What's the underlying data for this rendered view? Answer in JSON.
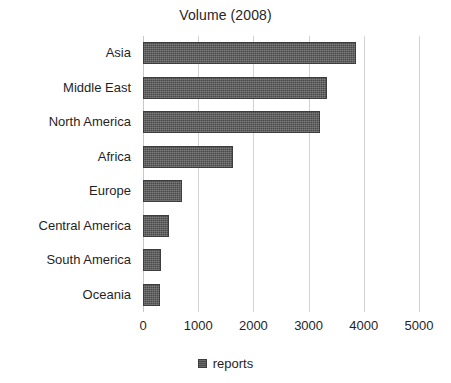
{
  "chart_data": {
    "type": "bar",
    "orientation": "horizontal",
    "title": "Volume (2008)",
    "xlabel": "",
    "ylabel": "",
    "xlim": [
      0,
      5000
    ],
    "xticks": [
      0,
      1000,
      2000,
      3000,
      4000,
      5000
    ],
    "xtick_labels": [
      "0",
      "1000",
      "2000",
      "3000",
      "4000",
      "5000"
    ],
    "grid": "vertical",
    "legend_position": "bottom-center",
    "legend": [
      "reports"
    ],
    "series_name": "reports",
    "bar_color": "#4a4a4a",
    "gridline_color": "#d2d2d2",
    "categories": [
      "Asia",
      "Middle East",
      "North America",
      "Africa",
      "Europe",
      "Central America",
      "South America",
      "Oceania"
    ],
    "values": [
      3850,
      3330,
      3200,
      1630,
      700,
      480,
      330,
      300
    ],
    "series": [
      {
        "name": "reports",
        "values": [
          3850,
          3330,
          3200,
          1630,
          700,
          480,
          330,
          300
        ]
      }
    ]
  }
}
